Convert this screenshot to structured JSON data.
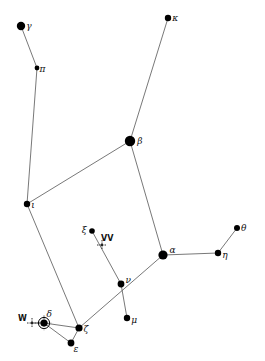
{
  "diagram": {
    "type": "constellation-star-chart",
    "colors": {
      "line": "#555555",
      "star": "#000000",
      "background": "#ffffff"
    },
    "stars": [
      {
        "id": "gamma",
        "label": "γ",
        "x": 21,
        "y": 26,
        "r": 4.2,
        "lx": 5,
        "ly": 3
      },
      {
        "id": "pi",
        "label": "π",
        "x": 37,
        "y": 68,
        "r": 2.4,
        "lx": 4,
        "ly": 4
      },
      {
        "id": "kappa",
        "label": "κ",
        "x": 168,
        "y": 18,
        "r": 3.2,
        "lx": 5,
        "ly": 3
      },
      {
        "id": "beta",
        "label": "β",
        "x": 130,
        "y": 141,
        "r": 5.2,
        "lx": 6,
        "ly": 3
      },
      {
        "id": "iota",
        "label": "ι",
        "x": 27,
        "y": 204,
        "r": 3.2,
        "lx": 5,
        "ly": 4
      },
      {
        "id": "xi",
        "label": "ξ",
        "x": 92,
        "y": 231,
        "r": 2.8,
        "lx": -9,
        "ly": 2
      },
      {
        "id": "alpha",
        "label": "α",
        "x": 163,
        "y": 255,
        "r": 4.6,
        "lx": 6,
        "ly": -2
      },
      {
        "id": "eta",
        "label": "η",
        "x": 218,
        "y": 253,
        "r": 3.2,
        "lx": 5,
        "ly": 5
      },
      {
        "id": "theta",
        "label": "θ",
        "x": 237,
        "y": 228,
        "r": 3.0,
        "lx": 5,
        "ly": 3
      },
      {
        "id": "nu",
        "label": "ν",
        "x": 121,
        "y": 284,
        "r": 3.4,
        "lx": 5,
        "ly": -1
      },
      {
        "id": "mu",
        "label": "μ",
        "x": 127,
        "y": 318,
        "r": 3.2,
        "lx": 5,
        "ly": 5
      },
      {
        "id": "zeta",
        "label": "ζ",
        "x": 79,
        "y": 328,
        "r": 3.6,
        "lx": 5,
        "ly": 4
      },
      {
        "id": "epsilon",
        "label": "ε",
        "x": 71,
        "y": 343,
        "r": 3.4,
        "lx": 3,
        "ly": 9
      },
      {
        "id": "delta",
        "label": "δ",
        "x": 44,
        "y": 323,
        "r": 3.6,
        "lx": 3,
        "ly": -6,
        "style": "ringed"
      }
    ],
    "variables": [
      {
        "id": "VV",
        "label": "VV",
        "x": 102,
        "y": 245,
        "lx": -1,
        "ly": -4
      },
      {
        "id": "W",
        "label": "W",
        "x": 32,
        "y": 323,
        "lx": -14,
        "ly": -2
      }
    ],
    "lines": [
      [
        "gamma",
        "pi"
      ],
      [
        "pi",
        "iota"
      ],
      [
        "iota",
        "beta"
      ],
      [
        "beta",
        "kappa"
      ],
      [
        "beta",
        "alpha"
      ],
      [
        "iota",
        "zeta"
      ],
      [
        "zeta",
        "alpha"
      ],
      [
        "alpha",
        "eta"
      ],
      [
        "eta",
        "theta"
      ],
      [
        "xi",
        "nu"
      ],
      [
        "nu",
        "mu"
      ],
      [
        "zeta",
        "delta"
      ],
      [
        "delta",
        "epsilon"
      ],
      [
        "epsilon",
        "zeta"
      ],
      [
        "W",
        "delta"
      ]
    ]
  }
}
